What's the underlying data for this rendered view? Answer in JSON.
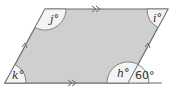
{
  "diagram": {
    "type": "parallelogram-angles",
    "shape_fill": "#cfcfcf",
    "stroke": "#6b6b6b",
    "angle_fill": "#f4f4f4",
    "angles": [
      {
        "id": "j",
        "label": "j°",
        "position": "top-left"
      },
      {
        "id": "i",
        "label": "i°",
        "position": "top-right"
      },
      {
        "id": "k",
        "label": "k°",
        "position": "bottom-left"
      },
      {
        "id": "h",
        "label": "h°",
        "position": "bottom-right-interior"
      },
      {
        "id": "given",
        "label": "60°",
        "position": "bottom-right-exterior"
      }
    ],
    "marks": {
      "top_bottom": "double-arrow (parallel)",
      "left_right": "single-arrow (parallel)"
    }
  }
}
